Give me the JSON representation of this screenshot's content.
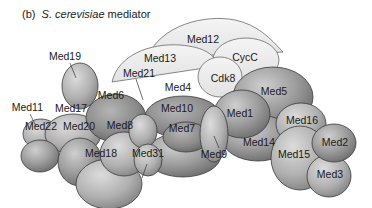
{
  "caption": {
    "panel": "(b)",
    "species": "S. cerevisiae",
    "suffix": " mediator"
  },
  "colors": {
    "light_fill": "#ececec",
    "light_stroke": "#6a6a6a",
    "dark_highlight": "#c8c8c8",
    "dark_shadow": "#6f6f6f",
    "stroke": "#3a3a3a",
    "text": "#1a1a1a"
  },
  "subunits": {
    "med12": "Med12",
    "cycc": "CycC",
    "med13": "Med13",
    "cdk8": "Cdk8",
    "med19": "Med19",
    "med11": "Med11",
    "med21": "Med21",
    "med6": "Med6",
    "med4": "Med4",
    "med5": "Med5",
    "med17": "Med17",
    "med10": "Med10",
    "med1": "Med1",
    "med22": "Med22",
    "med20": "Med20",
    "med8": "Med8",
    "med7": "Med7",
    "med9": "Med9",
    "med14": "Med14",
    "med16": "Med16",
    "med2": "Med2",
    "med15": "Med15",
    "med18": "Med18",
    "med31": "Med31",
    "med3": "Med3"
  }
}
